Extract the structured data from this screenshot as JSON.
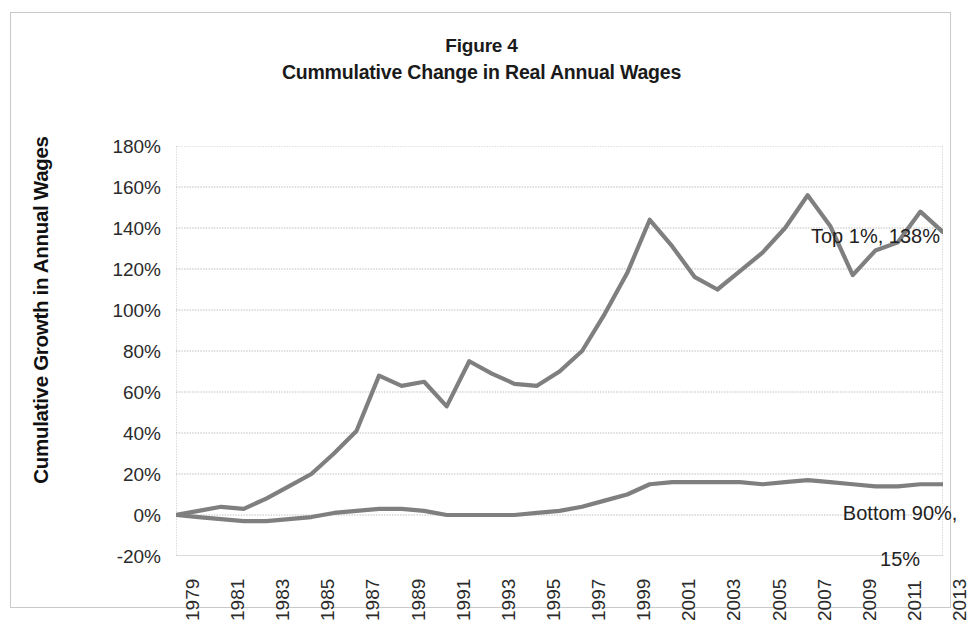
{
  "figure": {
    "title_line_1": "Figure 4",
    "title_line_2": "Cummulative Change in Real Annual Wages"
  },
  "axes": {
    "y_axis_title": "Cumulative Growth in Annual Wages",
    "y_ticks": [
      "180%",
      "160%",
      "140%",
      "120%",
      "100%",
      "80%",
      "60%",
      "40%",
      "20%",
      "0%",
      "-20%"
    ],
    "x_ticks": [
      "1979",
      "1981",
      "1983",
      "1985",
      "1987",
      "1989",
      "1991",
      "1993",
      "1995",
      "1997",
      "1999",
      "2001",
      "2003",
      "2005",
      "2007",
      "2009",
      "2011",
      "2013"
    ]
  },
  "annotations": {
    "top1_label": "Top 1%, 138%",
    "bottom90_label_line_1": "Bottom 90%,",
    "bottom90_label_line_2": "15%"
  },
  "colors": {
    "line": "#7f7f7f",
    "gridline": "#b8b8b8",
    "frame": "#c9c9c9",
    "text": "#222222",
    "background": "#ffffff"
  },
  "chart_data": {
    "type": "line",
    "xlabel": "",
    "ylabel": "Cumulative Growth in Annual Wages",
    "xlim": [
      1979,
      2013
    ],
    "ylim": [
      -20,
      180
    ],
    "ytick_step": 20,
    "grid": true,
    "legend": "inline annotations at right end of each series",
    "x": [
      1979,
      1980,
      1981,
      1982,
      1983,
      1984,
      1985,
      1986,
      1987,
      1988,
      1989,
      1990,
      1991,
      1992,
      1993,
      1994,
      1995,
      1996,
      1997,
      1998,
      1999,
      2000,
      2001,
      2002,
      2003,
      2004,
      2005,
      2006,
      2007,
      2008,
      2009,
      2010,
      2011,
      2012,
      2013
    ],
    "series": [
      {
        "name": "Top 1%",
        "end_label": "Top 1%, 138%",
        "values": [
          0,
          2,
          4,
          3,
          8,
          14,
          20,
          30,
          41,
          68,
          63,
          65,
          53,
          75,
          69,
          64,
          63,
          70,
          80,
          98,
          118,
          144,
          131,
          116,
          110,
          119,
          128,
          140,
          156,
          141,
          117,
          129,
          133,
          148,
          138
        ]
      },
      {
        "name": "Bottom 90%",
        "end_label": "Bottom 90%, 15%",
        "values": [
          0,
          -1,
          -2,
          -3,
          -3,
          -2,
          -1,
          1,
          2,
          3,
          3,
          2,
          0,
          0,
          0,
          0,
          1,
          2,
          4,
          7,
          10,
          15,
          16,
          16,
          16,
          16,
          15,
          16,
          17,
          16,
          15,
          14,
          14,
          15,
          15
        ]
      }
    ]
  }
}
